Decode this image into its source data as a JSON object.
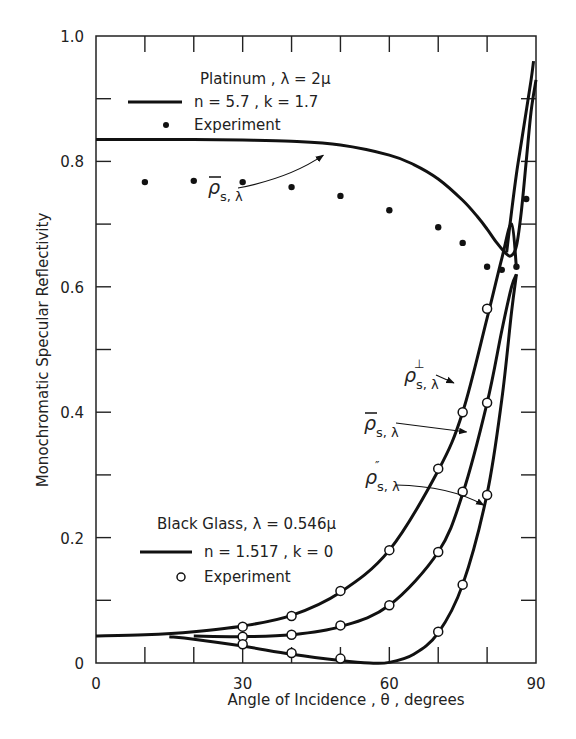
{
  "chart_data": {
    "type": "line",
    "title": "",
    "xlabel": "Angle of Incidence , θ , degrees",
    "ylabel": "Monochromatic  Specular  Reflectivity",
    "xlim": [
      0,
      90
    ],
    "ylim": [
      0,
      1.0
    ],
    "x_ticks": [
      0,
      30,
      60,
      90
    ],
    "x_tick_labels": [
      "0",
      "30",
      "60",
      "90"
    ],
    "x_minor_step": 10,
    "y_ticks": [
      0,
      0.2,
      0.4,
      0.6,
      0.8,
      1.0
    ],
    "y_tick_labels": [
      "0",
      "0.2",
      "0.4",
      "0.6",
      "0.8",
      "1.0"
    ],
    "y_minor_step": 0.1,
    "grid": false,
    "legends": [
      {
        "title": "Platinum , λ = 2μ",
        "line_label": "n = 5.7 , k = 1.7",
        "marker_label": "Experiment",
        "marker": "filled-dot"
      },
      {
        "title": "Black Glass, λ = 0.546μ",
        "line_label": "n = 1.517 , k = 0",
        "marker_label": "Experiment",
        "marker": "open-circle"
      }
    ],
    "series": [
      {
        "name": "Platinum theory ρ̄s,λ (n=5.7, k=1.7)",
        "kind": "line",
        "x": [
          0,
          10,
          20,
          30,
          40,
          50,
          60,
          65,
          70,
          75,
          78,
          80,
          82,
          84,
          85,
          86,
          87,
          88,
          89,
          90
        ],
        "y": [
          0.835,
          0.835,
          0.835,
          0.834,
          0.832,
          0.826,
          0.81,
          0.795,
          0.772,
          0.738,
          0.712,
          0.692,
          0.67,
          0.652,
          0.65,
          0.665,
          0.72,
          0.8,
          0.88,
          0.93
        ]
      },
      {
        "name": "Platinum theory ρ⊥ branch",
        "kind": "line",
        "x": [
          84,
          85,
          86,
          87,
          88,
          89,
          89.5
        ],
        "y": [
          0.655,
          0.72,
          0.78,
          0.83,
          0.88,
          0.93,
          0.96
        ]
      },
      {
        "name": "Platinum experiment",
        "kind": "scatter",
        "marker": "filled-dot",
        "x": [
          10,
          20,
          30,
          40,
          50,
          60,
          70,
          75,
          80,
          83,
          86,
          88
        ],
        "y": [
          0.767,
          0.769,
          0.767,
          0.759,
          0.745,
          0.722,
          0.695,
          0.67,
          0.632,
          0.627,
          0.632,
          0.74
        ]
      },
      {
        "name": "Black Glass ρ⊥s,λ",
        "kind": "line",
        "x": [
          0,
          10,
          20,
          30,
          40,
          50,
          60,
          70,
          75,
          80,
          83,
          85,
          86
        ],
        "y": [
          0.043,
          0.045,
          0.05,
          0.059,
          0.076,
          0.113,
          0.18,
          0.307,
          0.4,
          0.55,
          0.645,
          0.7,
          0.63
        ]
      },
      {
        "name": "Black Glass ρ̄s,λ",
        "kind": "line",
        "x": [
          20,
          30,
          40,
          50,
          60,
          70,
          75,
          80,
          83,
          85,
          86
        ],
        "y": [
          0.043,
          0.042,
          0.045,
          0.058,
          0.092,
          0.177,
          0.27,
          0.415,
          0.53,
          0.6,
          0.62
        ]
      },
      {
        "name": "Black Glass ρ∥s,λ",
        "kind": "line",
        "x": [
          15,
          20,
          30,
          40,
          50,
          56,
          60,
          65,
          70,
          75,
          80,
          83,
          85,
          86
        ],
        "y": [
          0.042,
          0.038,
          0.027,
          0.014,
          0.004,
          0.0,
          0.001,
          0.014,
          0.048,
          0.125,
          0.27,
          0.42,
          0.56,
          0.62
        ]
      },
      {
        "name": "Black Glass experiment ⊥",
        "kind": "scatter",
        "marker": "open-circle",
        "x": [
          30,
          40,
          50,
          60,
          70,
          75,
          80
        ],
        "y": [
          0.058,
          0.075,
          0.115,
          0.18,
          0.31,
          0.4,
          0.565
        ]
      },
      {
        "name": "Black Glass experiment avg",
        "kind": "scatter",
        "marker": "open-circle",
        "x": [
          30,
          40,
          50,
          60,
          70,
          75,
          80
        ],
        "y": [
          0.042,
          0.045,
          0.06,
          0.092,
          0.177,
          0.273,
          0.415
        ]
      },
      {
        "name": "Black Glass experiment ∥",
        "kind": "scatter",
        "marker": "open-circle",
        "x": [
          30,
          40,
          50,
          70,
          75,
          80
        ],
        "y": [
          0.03,
          0.016,
          0.007,
          0.05,
          0.125,
          0.268
        ]
      }
    ],
    "annotations": [
      {
        "text": "ρ̄s,λ",
        "target": "Platinum theory",
        "at": [
          29,
          0.72
        ],
        "arrow_to": [
          46,
          0.805
        ]
      },
      {
        "text": "ρ⊥s,λ",
        "at": [
          62,
          0.42
        ],
        "arrow_to": [
          73,
          0.415
        ]
      },
      {
        "text": "ρ̄s,λ",
        "at": [
          62,
          0.35
        ],
        "arrow_to": [
          76,
          0.34
        ]
      },
      {
        "text": "ρ∥s,λ",
        "at": [
          62,
          0.26
        ],
        "arrow_to": [
          78.5,
          0.24
        ]
      }
    ],
    "legend_position": "upper-left (Platinum), lower-left (Black Glass)"
  }
}
